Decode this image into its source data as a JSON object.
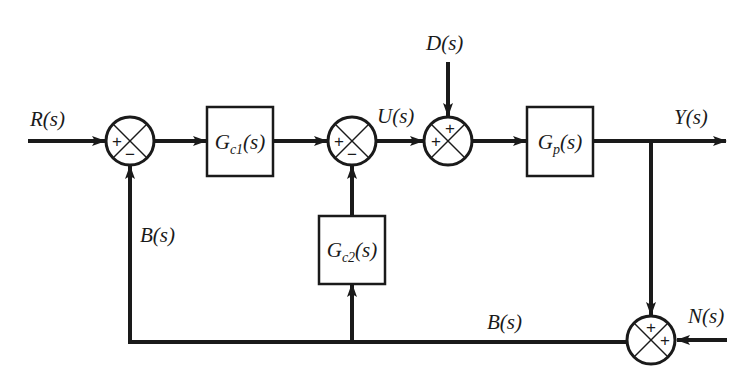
{
  "diagram": {
    "type": "control-system-block-diagram",
    "colors": {
      "stroke": "#1a1a1a",
      "background": "#ffffff"
    },
    "signals": {
      "input": "R(s)",
      "control": "U(s)",
      "disturbance": "D(s)",
      "output": "Y(s)",
      "noise": "N(s)",
      "feedback_left": "B(s)",
      "feedback_bottom": "B(s)"
    },
    "blocks": [
      {
        "id": "gc1",
        "base": "G",
        "sub": "c1",
        "arg": "(s)"
      },
      {
        "id": "gc2",
        "base": "G",
        "sub": "c2",
        "arg": "(s)"
      },
      {
        "id": "gp",
        "base": "G",
        "sub": "p",
        "arg": "(s)"
      }
    ],
    "summing_junctions": [
      {
        "id": "sum1",
        "signs": {
          "left": "+",
          "bottom": "−"
        }
      },
      {
        "id": "sum2",
        "signs": {
          "left": "+",
          "bottom": "−"
        }
      },
      {
        "id": "sum3",
        "signs": {
          "left": "+",
          "top": "+"
        }
      },
      {
        "id": "sum4",
        "signs": {
          "top": "+",
          "right": "+"
        }
      }
    ]
  }
}
